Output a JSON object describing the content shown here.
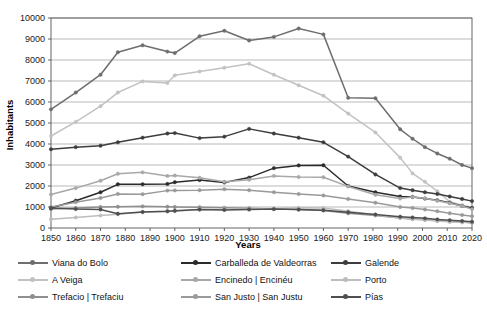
{
  "chart_data": {
    "type": "line",
    "title": "",
    "xlabel": "Years",
    "ylabel": "Inhabitants",
    "xlim": [
      1850,
      2020
    ],
    "ylim": [
      0,
      10000
    ],
    "ytick_step": 1000,
    "grid": "horizontal",
    "legend_position": "bottom",
    "x": [
      1850,
      1860,
      1870,
      1877,
      1887,
      1897,
      1900,
      1910,
      1920,
      1930,
      1940,
      1950,
      1960,
      1970,
      1981,
      1991,
      1996,
      2001,
      2006,
      2011,
      2016,
      2020
    ],
    "xticks": [
      1850,
      1860,
      1870,
      1880,
      1890,
      1900,
      1910,
      1920,
      1930,
      1940,
      1950,
      1960,
      1970,
      1980,
      1990,
      2000,
      2010,
      2020
    ],
    "yticks": [
      0,
      1000,
      2000,
      3000,
      4000,
      5000,
      6000,
      7000,
      8000,
      9000,
      10000
    ],
    "series": [
      {
        "name": "Viana do Bolo",
        "color": "#6e6e6e",
        "values": [
          5650,
          6450,
          7300,
          8370,
          8700,
          8400,
          8330,
          9130,
          9390,
          8930,
          9100,
          9500,
          9220,
          6200,
          6180,
          4700,
          4250,
          3850,
          3550,
          3300,
          3000,
          2850
        ]
      },
      {
        "name": "A Veiga",
        "color": "#c2c2c2",
        "values": [
          4380,
          5050,
          5800,
          6450,
          6980,
          6900,
          7270,
          7450,
          7630,
          7820,
          7300,
          6800,
          6300,
          5450,
          4550,
          3350,
          2600,
          2200,
          1750,
          1250,
          1080,
          980
        ]
      },
      {
        "name": "Trefacio | Trefaciu",
        "color": "#8f8f8f",
        "values": [
          900,
          950,
          1000,
          1010,
          1030,
          1010,
          1000,
          990,
          960,
          940,
          900,
          880,
          830,
          700,
          600,
          480,
          430,
          390,
          340,
          310,
          280,
          250
        ]
      },
      {
        "name": "Carballeda de Valdeorras",
        "color": "#2b2b2b",
        "values": [
          950,
          1300,
          1700,
          2080,
          2080,
          2100,
          2180,
          2280,
          2170,
          2400,
          2850,
          2980,
          2990,
          2000,
          1700,
          1500,
          1480,
          1400,
          1320,
          1200,
          1050,
          950
        ]
      },
      {
        "name": "Encinedo | Encinéu",
        "color": "#a8a8a8",
        "values": [
          1600,
          1900,
          2250,
          2580,
          2650,
          2480,
          2500,
          2390,
          2200,
          2300,
          2480,
          2430,
          2420,
          1980,
          1580,
          1400,
          1480,
          1420,
          1300,
          1180,
          1050,
          900
        ]
      },
      {
        "name": "San Justo | San Justu",
        "color": "#9a9a9a",
        "values": [
          1000,
          1230,
          1430,
          1620,
          1610,
          1780,
          1790,
          1800,
          1850,
          1800,
          1700,
          1620,
          1550,
          1380,
          1200,
          1000,
          950,
          880,
          800,
          700,
          620,
          560
        ]
      },
      {
        "name": "Galende",
        "color": "#3d3d3d",
        "values": [
          3750,
          3850,
          3920,
          4080,
          4300,
          4500,
          4520,
          4280,
          4350,
          4720,
          4500,
          4300,
          4080,
          3400,
          2550,
          1900,
          1800,
          1700,
          1620,
          1500,
          1380,
          1280
        ]
      },
      {
        "name": "Porto",
        "color": "#bdbdbd",
        "values": [
          420,
          500,
          590,
          650,
          760,
          790,
          800,
          880,
          880,
          900,
          930,
          960,
          950,
          800,
          620,
          480,
          420,
          380,
          330,
          300,
          270,
          250
        ]
      },
      {
        "name": "Pías",
        "color": "#4f4f4f",
        "values": [
          950,
          900,
          880,
          680,
          760,
          800,
          820,
          880,
          860,
          880,
          900,
          880,
          850,
          750,
          640,
          540,
          500,
          460,
          410,
          370,
          330,
          300
        ]
      }
    ]
  },
  "legend": {
    "items": [
      {
        "label": "Viana do Bolo",
        "color": "#6e6e6e"
      },
      {
        "label": "A Veiga",
        "color": "#c2c2c2"
      },
      {
        "label": "Trefacio | Trefaciu",
        "color": "#8f8f8f"
      },
      {
        "label": "Carballeda de Valdeorras",
        "color": "#2b2b2b"
      },
      {
        "label": "Encinedo | Encinéu",
        "color": "#a8a8a8"
      },
      {
        "label": "San Justo | San Justu",
        "color": "#9a9a9a"
      },
      {
        "label": "Galende",
        "color": "#3d3d3d"
      },
      {
        "label": "Porto",
        "color": "#bdbdbd"
      },
      {
        "label": "Pías",
        "color": "#4f4f4f"
      }
    ]
  },
  "style": {
    "grid_color": "#9b9b9b",
    "axis_color": "#555555",
    "background": "#ffffff"
  }
}
